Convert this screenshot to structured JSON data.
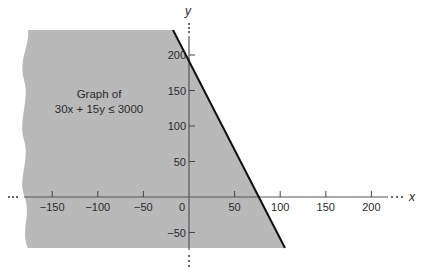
{
  "chart_data": {
    "type": "area",
    "title": "",
    "annotation": [
      "Graph of",
      "30x + 15y ≤ 3000"
    ],
    "inequality": "30x + 15y <= 3000",
    "boundary_line": {
      "equation": "30x + 15y = 3000",
      "x_intercept": 100,
      "y_intercept": 200,
      "slope": -2
    },
    "shaded_region": "below/left of boundary line (30x + 15y <= 3000)",
    "xlabel": "x",
    "ylabel": "y",
    "xlim": [
      -170,
      220
    ],
    "ylim": [
      -70,
      230
    ],
    "x_ticks": [
      -150,
      -100,
      -50,
      0,
      50,
      100,
      150,
      200
    ],
    "y_ticks": [
      -50,
      50,
      100,
      150,
      200
    ],
    "x_tick_labels": [
      "−150",
      "−100",
      "−50",
      "0",
      "50",
      "100",
      "150",
      "200"
    ],
    "y_tick_labels": [
      "−50",
      "50",
      "100",
      "150",
      "200"
    ],
    "grid": false,
    "legend": null,
    "colors": {
      "shade": "#b9b9b9",
      "line": "#111111",
      "axis": "#555555",
      "text": "#2a2a2a"
    }
  }
}
